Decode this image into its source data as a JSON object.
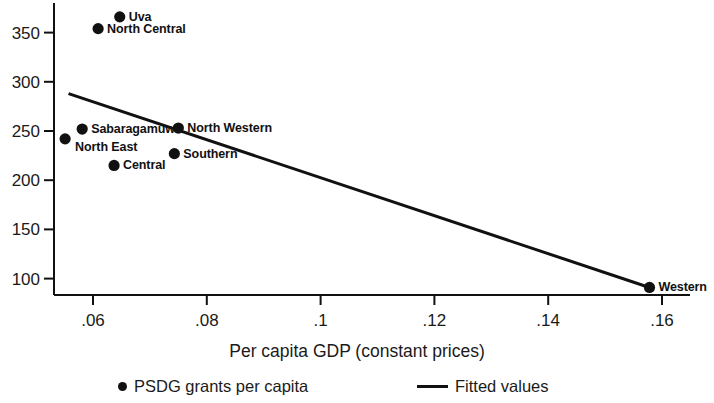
{
  "chart_data": {
    "type": "scatter",
    "title": "",
    "xlabel": "Per capita GDP (constant prices)",
    "ylabel": "",
    "xlim": [
      0.0525,
      0.1655
    ],
    "ylim": [
      85,
      375
    ],
    "grid": false,
    "legend_position": "bottom",
    "xticks": [
      {
        "value": 0.06,
        "label": ".06"
      },
      {
        "value": 0.08,
        "label": ".08"
      },
      {
        "value": 0.1,
        "label": ".1"
      },
      {
        "value": 0.12,
        "label": ".12"
      },
      {
        "value": 0.14,
        "label": ".14"
      },
      {
        "value": 0.16,
        "label": ".16"
      }
    ],
    "yticks": [
      {
        "value": 100,
        "label": "100"
      },
      {
        "value": 150,
        "label": "150"
      },
      {
        "value": 200,
        "label": "200"
      },
      {
        "value": 250,
        "label": "250"
      },
      {
        "value": 300,
        "label": "300"
      },
      {
        "value": 350,
        "label": "350"
      }
    ],
    "series": [
      {
        "name": "PSDG grants per capita",
        "type": "scatter",
        "marker": "circle",
        "color": "#111111",
        "points": [
          {
            "label": "Uva",
            "x": 0.0647,
            "y": 366,
            "label_pos": "right"
          },
          {
            "label": "North Central",
            "x": 0.0609,
            "y": 354,
            "label_pos": "right"
          },
          {
            "label": "Sabaragamuwa",
            "x": 0.0581,
            "y": 252,
            "label_pos": "right"
          },
          {
            "label": "North East",
            "x": 0.0551,
            "y": 242,
            "label_pos": "right-below"
          },
          {
            "label": "Central",
            "x": 0.0637,
            "y": 215,
            "label_pos": "right"
          },
          {
            "label": "North Western",
            "x": 0.075,
            "y": 253,
            "label_pos": "right"
          },
          {
            "label": "Southern",
            "x": 0.0743,
            "y": 227,
            "label_pos": "right"
          },
          {
            "label": "Western",
            "x": 0.1578,
            "y": 91,
            "label_pos": "right"
          }
        ]
      },
      {
        "name": "Fitted values",
        "type": "line",
        "color": "#111111",
        "x": [
          0.0557,
          0.1578
        ],
        "y": [
          288,
          91
        ]
      }
    ]
  },
  "legend": {
    "entries": [
      {
        "marker": "dot",
        "label": "PSDG grants per capita"
      },
      {
        "marker": "line",
        "label": "Fitted values"
      }
    ]
  },
  "axis_title": "Per capita GDP (constant prices)"
}
